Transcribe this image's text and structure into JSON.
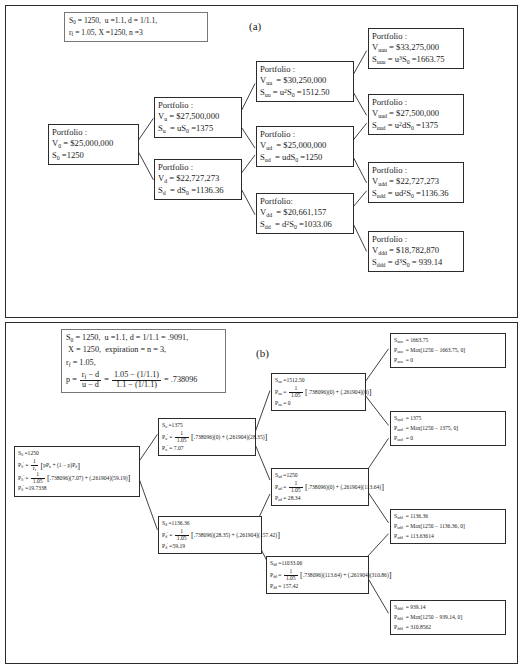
{
  "figure": {
    "panel_a_label": "(a)",
    "panel_b_label": "(b)"
  },
  "panel_a": {
    "params": {
      "line1": "S0 = 1250,  u = 1.1, d = 1/1.1,",
      "line2": "rf = 1.05, X = 1250, n = 3"
    },
    "nodes": [
      {
        "id": "root",
        "title": "Portfolio :",
        "value_label": "V0",
        "value": "$25,000,000",
        "stock_label": "S0",
        "stock": "1250",
        "stock_expr": ""
      },
      {
        "id": "u",
        "title": "Portfolio :",
        "value_label": "Vu",
        "value": "$27,500,000",
        "stock_label": "Su",
        "stock": "1375",
        "stock_expr": "uS0"
      },
      {
        "id": "d",
        "title": "Portfolio :",
        "value_label": "Vd",
        "value": "$22,727,273",
        "stock_label": "Sd",
        "stock": "1136.36",
        "stock_expr": "dS0"
      },
      {
        "id": "uu",
        "title": "Portfolio :",
        "value_label": "Vuu",
        "value": "$30,250,000",
        "stock_label": "Suu",
        "stock": "1512.50",
        "stock_expr": "u2S0"
      },
      {
        "id": "ud",
        "title": "Portfolio :",
        "value_label": "Vud",
        "value": "$25,000,000",
        "stock_label": "Sud",
        "stock": "1250",
        "stock_expr": "udS0"
      },
      {
        "id": "dd",
        "title": "Portfolio:",
        "value_label": "Vdd",
        "value": "$20,661,157",
        "stock_label": "Sdd",
        "stock": "1033.06",
        "stock_expr": "d2S0"
      },
      {
        "id": "uuu",
        "title": "Portfolio :",
        "value_label": "Vuuu",
        "value": "$33,275,000",
        "stock_label": "Suuu",
        "stock": "1663.75",
        "stock_expr": "u3S0"
      },
      {
        "id": "uud",
        "title": "Portfolio :",
        "value_label": "Vuud",
        "value": "$27,500,000",
        "stock_label": "Suud",
        "stock": "1375",
        "stock_expr": "u2dS0"
      },
      {
        "id": "udd",
        "title": "Portfolio :",
        "value_label": "Vudd",
        "value": "$22,727,273",
        "stock_label": "Sudd",
        "stock": "1136.36",
        "stock_expr": "ud2S0"
      },
      {
        "id": "ddd",
        "title": "Portfolio :",
        "value_label": "Vddd",
        "value": "$18,782,870",
        "stock_label": "Sddd",
        "stock": "939.14",
        "stock_expr": "d3S0"
      }
    ]
  },
  "panel_b": {
    "params": {
      "line1": "S0 = 1250,  u = 1.1, d = 1/1.1 = .9091,",
      "line2": "X = 1250,  expiration = n = 3,",
      "line3": "rf = 1.05,",
      "formula_label": "p =",
      "frac1_num": "rf − d",
      "frac1_den": "u − d",
      "frac2_num": "1.05 − (1/1.1)",
      "frac2_den": "1.1 − (1/1.1)",
      "result": "= .738096"
    },
    "nodes": [
      {
        "id": "b-root",
        "s_label": "S0",
        "s_value": "1250",
        "p_label": "P0",
        "p_prime": true,
        "formula_generic": "[pPu + (1 − p)Pd]",
        "disc_den": "rf",
        "calc_num": "1",
        "calc_den": "1.05",
        "calc_expr": "[.738096)(7.07) + (.261904)(59.19)]",
        "result_label": "P0",
        "result": "19.7338"
      },
      {
        "id": "b-u",
        "s_label": "Su",
        "s_value": "1375",
        "p_label": "Pu",
        "p_prime": true,
        "calc_num": "1",
        "calc_den": "1.05",
        "calc_expr": "[.738096)(0) + (.261904)(28.35)]",
        "result_label": "Pu",
        "result": "7.07"
      },
      {
        "id": "b-d",
        "s_label": "Sd",
        "s_value": "1136.36",
        "p_label": "Pd",
        "p_prime": true,
        "calc_num": "1",
        "calc_den": "1.05",
        "calc_expr": "[.738096)(28.35) + (.261904)(157.42)]",
        "result_label": "Pd",
        "result": "59.19"
      },
      {
        "id": "b-uu",
        "s_label": "Suu",
        "s_value": "1512.50",
        "p_label": "Puu",
        "p_prime": true,
        "calc_num": "1",
        "calc_den": "1.05",
        "calc_expr": "[.738096)(0) + (.261904)(0)]",
        "result_label": "Puu",
        "result": "0"
      },
      {
        "id": "b-ud",
        "s_label": "Sud",
        "s_value": "1250",
        "p_label": "Pud",
        "p_prime": true,
        "calc_num": "1",
        "calc_den": "1.05",
        "calc_expr": "[.738096)(0) + (.261904)(113.64)]",
        "result_label": "Pud",
        "result": "28.34"
      },
      {
        "id": "b-dd",
        "s_label": "Sdd",
        "s_value": "11033.06",
        "p_label": "Pdd",
        "p_prime": true,
        "calc_num": "1",
        "calc_den": "1.05",
        "calc_expr": "[.738096)(113.64) + (.261904)(310.86)]",
        "result_label": "Pdd",
        "result": "157.42"
      }
    ],
    "terminals": [
      {
        "id": "t-uuu",
        "s_label": "Suuu",
        "s_value": "1663.75",
        "p_label": "Puuu",
        "p_expr": "Max[1250 − 1663.75, 0]",
        "result_label": "Puuu",
        "result": "0"
      },
      {
        "id": "t-uud",
        "s_label": "Suud",
        "s_value": "1375",
        "p_label": "Puud",
        "p_expr": "Max[1250 − 1375, 0]",
        "result_label": "Puud",
        "result": "0"
      },
      {
        "id": "t-udd",
        "s_label": "Sudd",
        "s_value": "1136.36",
        "p_label": "Pudd",
        "p_expr": "Max[1250 − 1136.36, 0]",
        "result_label": "Pudd",
        "result": "113.63614"
      },
      {
        "id": "t-ddd",
        "s_label": "Sddd",
        "s_value": "939.14",
        "p_label": "Pddd",
        "p_expr": "Max[1250 − 939.14, 0]",
        "result_label": "Pddd",
        "result": "310.8562"
      }
    ]
  }
}
